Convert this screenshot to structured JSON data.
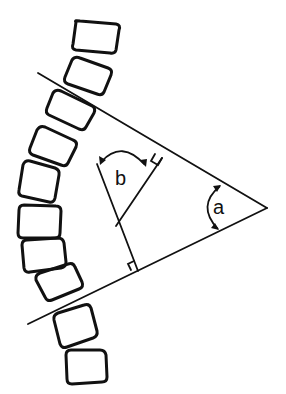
{
  "diagram": {
    "type": "Cobb angle measurement on spinal curvature",
    "labels": {
      "angle_a": "a",
      "angle_b": "b"
    },
    "colors": {
      "ink": "#111111",
      "background": "#ffffff"
    },
    "vertebrae_count": 10,
    "vertebrae": [
      {
        "cx": 96,
        "cy": 36,
        "w": 46,
        "h": 30,
        "rot": 5
      },
      {
        "cx": 88,
        "cy": 75,
        "w": 44,
        "h": 30,
        "rot": 22
      },
      {
        "cx": 70,
        "cy": 108,
        "w": 44,
        "h": 30,
        "rot": 28
      },
      {
        "cx": 53,
        "cy": 148,
        "w": 44,
        "h": 30,
        "rot": 22
      },
      {
        "cx": 40,
        "cy": 185,
        "w": 44,
        "h": 30,
        "rot": 12
      },
      {
        "cx": 39,
        "cy": 222,
        "w": 42,
        "h": 30,
        "rot": 0
      },
      {
        "cx": 44,
        "cy": 257,
        "w": 42,
        "h": 30,
        "rot": -8
      },
      {
        "cx": 58,
        "cy": 290,
        "w": 44,
        "h": 30,
        "rot": -18
      },
      {
        "cx": 74,
        "cy": 330,
        "w": 44,
        "h": 30,
        "rot": -15
      },
      {
        "cx": 86,
        "cy": 367,
        "w": 42,
        "h": 30,
        "rot": -5
      }
    ],
    "tangent_lines": {
      "upper": {
        "x1": 38,
        "y1": 73,
        "x2": 267,
        "y2": 208
      },
      "lower": {
        "x1": 28,
        "y1": 324,
        "x2": 267,
        "y2": 208
      }
    },
    "perpendiculars": {
      "from_upper": {
        "x1": 162,
        "y1": 158,
        "x2": 116,
        "y2": 226
      },
      "from_lower": {
        "x1": 138,
        "y1": 271,
        "x2": 97,
        "y2": 164
      }
    },
    "right_angle_markers": [
      {
        "at": "upper",
        "x": 162,
        "y": 158
      },
      {
        "at": "lower",
        "x": 138,
        "y": 271
      }
    ]
  }
}
